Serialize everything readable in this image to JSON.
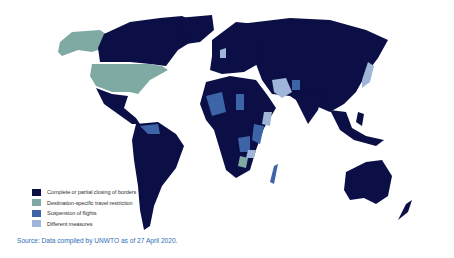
{
  "map": {
    "title": "Travel restrictions world map",
    "colors": {
      "complete_closing": "#0b0f45",
      "destination_specific": "#7fa9a3",
      "suspension_flights": "#3e64a8",
      "different_measures": "#9fb6d8"
    }
  },
  "legend": {
    "items": [
      {
        "label": "Complete or partial closing of borders",
        "color": "#0b0f45"
      },
      {
        "label": "Destination-specific travel restriction",
        "color": "#7fa9a3"
      },
      {
        "label": "Suspension of flights",
        "color": "#3e64a8"
      },
      {
        "label": "Different measures",
        "color": "#9fb6d8"
      }
    ]
  },
  "source": {
    "text": "Source: Data compiled by UNWTO as of 27 April 2020."
  }
}
